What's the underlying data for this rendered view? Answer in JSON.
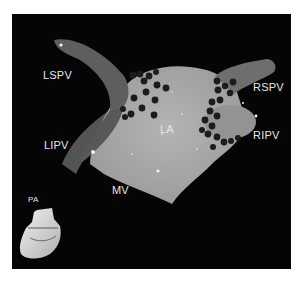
{
  "figure": {
    "labels": {
      "lspv": "LSPV",
      "lipv": "LIPV",
      "rspv": "RSPV",
      "ripv": "RIPV",
      "la": "LA",
      "mv": "MV",
      "pa": "PA"
    },
    "colors": {
      "background": "#050505",
      "atrium": "#a9a9a9",
      "veins_left": "#5f5f5f",
      "veins_right": "#707070",
      "lesion": "#1c1c1c",
      "label": "#e6e6e6",
      "border": "#ffffff"
    }
  }
}
